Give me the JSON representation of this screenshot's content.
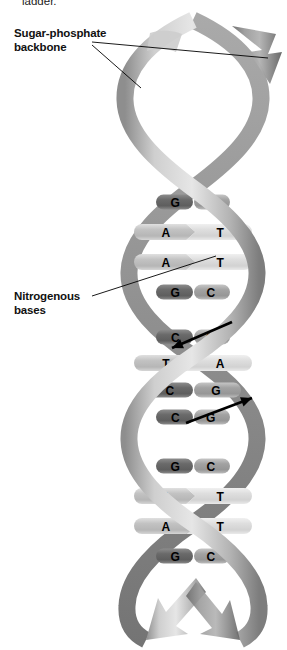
{
  "figure": {
    "caption_fragment": "ladder.",
    "background_color": "#ffffff"
  },
  "labels": [
    {
      "id": "sugar-phosphate-backbone",
      "text": "Sugar-phosphate\nbackbone",
      "color": "#111111"
    },
    {
      "id": "nitrogenous-bases",
      "text": "Nitrogenous\nbases",
      "color": "#111111"
    }
  ],
  "leader_lines": [
    {
      "name": "backbone-leader-upper",
      "from": [
        92,
        42
      ],
      "to": [
        268,
        58
      ]
    },
    {
      "name": "backbone-leader-lower",
      "from": [
        92,
        45
      ],
      "to": [
        141,
        88
      ]
    },
    {
      "name": "bases-leader",
      "from": [
        92,
        296
      ],
      "to": [
        216,
        256
      ]
    }
  ],
  "helix": {
    "strand_color_light": "#d8d8d8",
    "strand_color_mid": "#9a9a9a",
    "strand_color_dark": "#6e6e6e",
    "outline_color": "#5c5c5c",
    "turns": 3,
    "center_x": 193,
    "top_y": 20,
    "bottom_y": 636,
    "amplitude": 68,
    "ribbon_width": 17
  },
  "base_pairs": [
    {
      "section": 1,
      "y": 202,
      "left": "G",
      "right": "C",
      "type": "GC",
      "width": 74,
      "shape": "rounded"
    },
    {
      "section": 1,
      "y": 232,
      "left": "A",
      "right": "T",
      "type": "AT",
      "width": 118,
      "shape": "chevron"
    },
    {
      "section": 1,
      "y": 262,
      "left": "A",
      "right": "T",
      "type": "AT",
      "width": 118,
      "shape": "chevron"
    },
    {
      "section": 1,
      "y": 292,
      "left": "G",
      "right": "C",
      "type": "GC",
      "width": 74,
      "shape": "rounded"
    },
    {
      "section": 2,
      "y": 337,
      "left": "C",
      "right": "G",
      "type": "GC",
      "width": 74,
      "shape": "rounded"
    },
    {
      "section": 2,
      "y": 363,
      "left": "T",
      "right": "A",
      "type": "AT",
      "width": 118,
      "shape": "chevron"
    },
    {
      "section": 2,
      "y": 390,
      "left": "C",
      "right": "G",
      "type": "GC",
      "width": 96,
      "shape": "rounded"
    },
    {
      "section": 2,
      "y": 417,
      "left": "C",
      "right": "G",
      "type": "GC",
      "width": 74,
      "shape": "rounded"
    },
    {
      "section": 3,
      "y": 466,
      "left": "G",
      "right": "C",
      "type": "GC",
      "width": 74,
      "shape": "rounded"
    },
    {
      "section": 3,
      "y": 496,
      "left": "A",
      "right": "T",
      "type": "AT",
      "width": 118,
      "shape": "chevron"
    },
    {
      "section": 3,
      "y": 526,
      "left": "A",
      "right": "T",
      "type": "AT",
      "width": 118,
      "shape": "chevron"
    },
    {
      "section": 3,
      "y": 556,
      "left": "G",
      "right": "C",
      "type": "GC",
      "width": 74,
      "shape": "rounded"
    }
  ],
  "direction_arrows": [
    {
      "name": "antiparallel-arrow-down",
      "direction": "down-left",
      "from": [
        232,
        322
      ],
      "to": [
        172,
        348
      ]
    },
    {
      "name": "antiparallel-arrow-up",
      "direction": "up-right",
      "from": [
        186,
        423
      ],
      "to": [
        252,
        398
      ]
    }
  ],
  "base_colors": {
    "GC_dark": "#707070",
    "GC_light": "#a8a8a8",
    "AT_light": "#c9c9c9",
    "AT_lighter": "#e2e2e2",
    "letter_color": "#000000"
  }
}
